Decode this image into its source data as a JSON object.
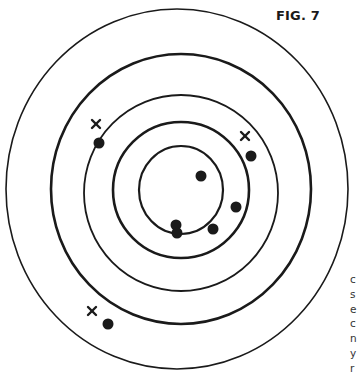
{
  "figure": {
    "label": "FIG. 7",
    "stroke_color": "#1a1a1a",
    "background": "#ffffff"
  },
  "side_text_fragments": [
    "c",
    "s",
    "e",
    "c",
    "n",
    "y",
    "r"
  ],
  "rings": [
    {
      "name": "ring-1-outer",
      "cx": 177,
      "cy": 189,
      "rx": 171,
      "ry": 180,
      "stroke": 1.6
    },
    {
      "name": "ring-2",
      "cx": 181,
      "cy": 189,
      "rx": 130,
      "ry": 135,
      "stroke": 2.6
    },
    {
      "name": "ring-3",
      "cx": 181,
      "cy": 193,
      "rx": 97,
      "ry": 98,
      "stroke": 1.8
    },
    {
      "name": "ring-4",
      "cx": 181,
      "cy": 190,
      "rx": 68,
      "ry": 68,
      "stroke": 2.6
    },
    {
      "name": "ring-5-inner",
      "cx": 181,
      "cy": 190,
      "rx": 42,
      "ry": 44,
      "stroke": 2.2
    }
  ],
  "marks": [
    {
      "type": "x",
      "x": 96,
      "y": 124
    },
    {
      "type": "x",
      "x": 245,
      "y": 136
    },
    {
      "type": "x",
      "x": 92,
      "y": 311
    }
  ],
  "dots": [
    {
      "x": 99,
      "y": 143
    },
    {
      "x": 251,
      "y": 156
    },
    {
      "x": 201,
      "y": 176
    },
    {
      "x": 236,
      "y": 207
    },
    {
      "x": 176,
      "y": 225
    },
    {
      "x": 177,
      "y": 233
    },
    {
      "x": 213,
      "y": 229
    },
    {
      "x": 108,
      "y": 324
    }
  ]
}
